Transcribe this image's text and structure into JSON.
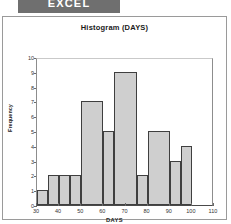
{
  "banner": {
    "label": "EXCEL"
  },
  "chart_data": {
    "type": "bar",
    "title": "Histogram (DAYS)",
    "xlabel": "DAYS",
    "ylabel": "Frequency",
    "xlim": [
      30,
      110
    ],
    "ylim": [
      0,
      10
    ],
    "grid": false,
    "legend": null,
    "xticks": [
      "30",
      "40",
      "50",
      "60",
      "70",
      "80",
      "90",
      "100",
      "110"
    ],
    "yticks": [
      "0",
      "1",
      "2",
      "3",
      "4",
      "5",
      "6",
      "7",
      "8",
      "9",
      "10"
    ],
    "bin_width": 5,
    "categories": [
      "30-35",
      "35-40",
      "40-45",
      "45-50",
      "50-55",
      "55-60",
      "60-65",
      "65-70",
      "70-75",
      "75-80",
      "80-85",
      "85-90",
      "90-95",
      "95-100",
      "100-105",
      "105-110"
    ],
    "values": [
      1,
      2,
      2,
      2,
      7,
      7,
      5,
      9,
      9,
      2,
      5,
      5,
      3,
      4,
      0,
      0
    ],
    "bars": [
      {
        "start": 30,
        "end": 35,
        "value": 1
      },
      {
        "start": 35,
        "end": 40,
        "value": 2
      },
      {
        "start": 40,
        "end": 45,
        "value": 2
      },
      {
        "start": 45,
        "end": 50,
        "value": 2
      },
      {
        "start": 50,
        "end": 60,
        "value": 7
      },
      {
        "start": 60,
        "end": 65,
        "value": 5
      },
      {
        "start": 65,
        "end": 75,
        "value": 9
      },
      {
        "start": 75,
        "end": 80,
        "value": 2
      },
      {
        "start": 80,
        "end": 90,
        "value": 5
      },
      {
        "start": 90,
        "end": 95,
        "value": 3
      },
      {
        "start": 95,
        "end": 100,
        "value": 4
      }
    ],
    "colors": {
      "bar_fill": "#cfcfcf",
      "bar_border": "#3f3f3f",
      "axis": "#4a4a4a"
    }
  }
}
